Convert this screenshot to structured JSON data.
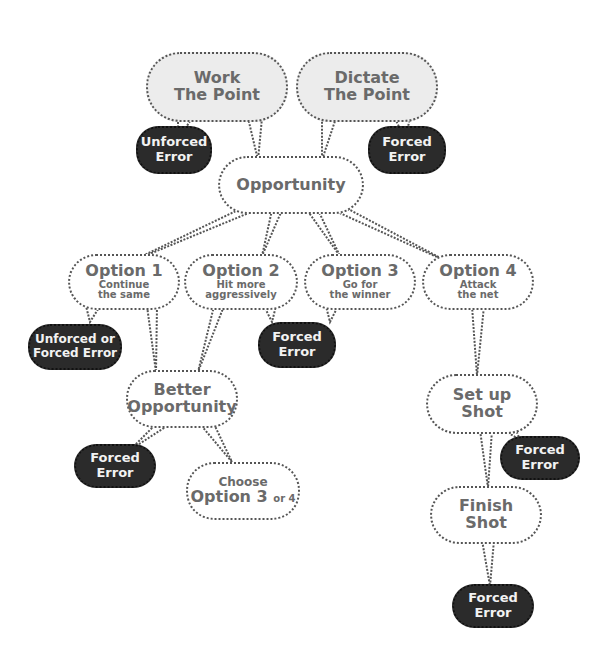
{
  "diagram": {
    "nodes": {
      "work_point": {
        "line1": "Work",
        "line2": "The Point"
      },
      "dictate_point": {
        "line1": "Dictate",
        "line2": "The Point"
      },
      "opportunity": {
        "label": "Opportunity"
      },
      "option1": {
        "title": "Option 1",
        "line1": "Continue",
        "line2": "the same"
      },
      "option2": {
        "title": "Option 2",
        "line1": "Hit more",
        "line2": "aggressively"
      },
      "option3": {
        "title": "Option 3",
        "line1": "Go for",
        "line2": "the winner"
      },
      "option4": {
        "title": "Option 4",
        "line1": "Attack",
        "line2": "the net"
      },
      "better_opportunity": {
        "line1": "Better",
        "line2": "Opportunity"
      },
      "choose": {
        "line1": "Choose",
        "option": "Option 3",
        "or": "or 4"
      },
      "setup_shot": {
        "line1": "Set up",
        "line2": "Shot"
      },
      "finish_shot": {
        "line1": "Finish",
        "line2": "Shot"
      }
    },
    "errors": {
      "err_work": {
        "line1": "Unforced",
        "line2": "Error"
      },
      "err_dictate": {
        "line1": "Forced",
        "line2": "Error"
      },
      "err_option1": {
        "line1": "Unforced or",
        "line2": "Forced Error"
      },
      "err_option23": {
        "line1": "Forced",
        "line2": "Error"
      },
      "err_better": {
        "line1": "Forced",
        "line2": "Error"
      },
      "err_setup": {
        "line1": "Forced",
        "line2": "Error"
      },
      "err_finish": {
        "line1": "Forced",
        "line2": "Error"
      }
    },
    "colors": {
      "bubble_fill": "#ffffff",
      "top_fill": "#ececec",
      "error_fill": "#2b2b2b",
      "outline": "#555555",
      "text": "#6a6a6a",
      "error_text": "#f2f2f2"
    }
  }
}
